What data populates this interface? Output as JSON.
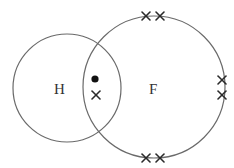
{
  "diagram": {
    "atoms": [
      {
        "symbol": "H",
        "name": "hydrogen"
      },
      {
        "symbol": "F",
        "name": "fluorine"
      }
    ],
    "shared_pair": {
      "electrons": [
        {
          "owner": "H",
          "marker": "dot"
        },
        {
          "owner": "F",
          "marker": "cross"
        }
      ]
    },
    "lone_pairs": [
      {
        "owner": "F",
        "position": "top",
        "marker": "cross",
        "count": 2
      },
      {
        "owner": "F",
        "position": "right",
        "marker": "cross",
        "count": 2
      },
      {
        "owner": "F",
        "position": "bottom",
        "marker": "cross",
        "count": 2
      }
    ],
    "colors": {
      "orbit": "#6a6a6a",
      "marker": "#2a2a2a",
      "label": "#333333"
    }
  }
}
